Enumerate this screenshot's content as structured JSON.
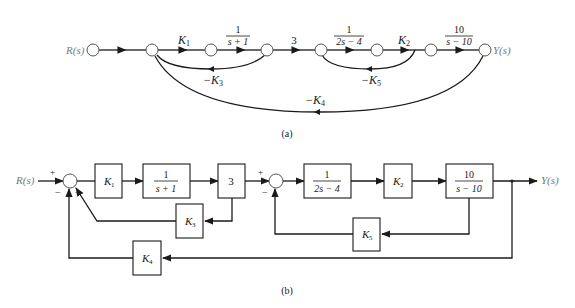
{
  "figure": {
    "part_a": {
      "caption": "(a)",
      "type": "signal-flow-graph",
      "input_label": "R(s)",
      "output_label": "Y(s)",
      "forward_branches": [
        {
          "gain": "1"
        },
        {
          "gain_main": "K",
          "gain_sub": "1"
        },
        {
          "num": "1",
          "den": "s + 1"
        },
        {
          "gain": "3"
        },
        {
          "num": "1",
          "den": "2s − 4"
        },
        {
          "gain_main": "K",
          "gain_sub": "2"
        },
        {
          "num": "10",
          "den": "s − 10"
        }
      ],
      "feedback_branches": [
        {
          "label_main": "−K",
          "label_sub": "3"
        },
        {
          "label_main": "−K",
          "label_sub": "5"
        },
        {
          "label_main": "−K",
          "label_sub": "4"
        }
      ]
    },
    "part_b": {
      "caption": "(b)",
      "type": "block-diagram",
      "input_label": "R(s)",
      "output_label": "Y(s)",
      "summer1": {
        "plus": "+",
        "minus1": "−",
        "minus2": "−"
      },
      "summer2": {
        "plus": "+",
        "minus": "−"
      },
      "blocks": {
        "k1": {
          "main": "K",
          "sub": "1"
        },
        "g1": {
          "num": "1",
          "den": "s + 1"
        },
        "three": {
          "value": "3"
        },
        "g2": {
          "num": "1",
          "den": "2s − 4"
        },
        "k2": {
          "main": "K",
          "sub": "2"
        },
        "g3": {
          "num": "10",
          "den": "s − 10"
        },
        "k3": {
          "main": "K",
          "sub": "3"
        },
        "k4": {
          "main": "K",
          "sub": "4"
        },
        "k5": {
          "main": "K",
          "sub": "5"
        }
      }
    }
  }
}
